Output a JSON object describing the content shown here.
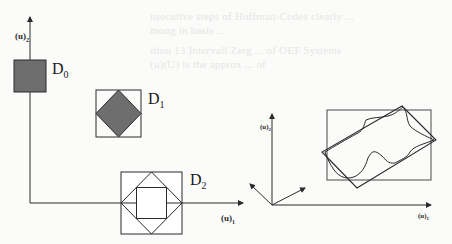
{
  "figure": {
    "left_panel": {
      "y_axis_label": "(u)",
      "y_axis_subscript": "2",
      "x_axis_label": "(u)",
      "x_axis_subscript": "1",
      "domains": [
        {
          "label": "D",
          "subscript": "0",
          "description": "filled square"
        },
        {
          "label": "D",
          "subscript": "1",
          "description": "square with filled inscribed diamond"
        },
        {
          "label": "D",
          "subscript": "2",
          "description": "square with inscribed diamond and inner square"
        }
      ]
    },
    "right_panel": {
      "y_axis_label": "(u)",
      "y_axis_subscript": "2",
      "x_axis_label": "(u)",
      "x_axis_subscript": "1",
      "description": "rotated rectangle enclosing irregular region, with axis-aligned bounding rectangle and rotated basis vectors"
    },
    "colors": {
      "stroke": "#2b2b2b",
      "fill": "#6e6e6e",
      "background": "#fbfbfa"
    }
  },
  "bleed_through_text": [
    "nsecutive steps of Huffman-Codes clearly ...",
    "mong in basis ...",
    "ition 13 Intervall Zerg  ... of OEF Systems",
    "(u)(U) is the approx ... of"
  ]
}
